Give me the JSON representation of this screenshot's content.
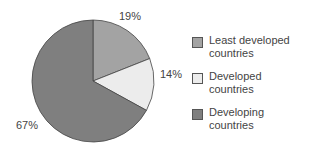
{
  "chart_data": {
    "type": "pie",
    "title": "",
    "categories": [
      "Least developed countries",
      "Developed countries",
      "Developing countries"
    ],
    "values": [
      19,
      14,
      67
    ],
    "labels": [
      "19%",
      "14%",
      "67%"
    ],
    "colors": [
      "#a3a3a3",
      "#ececec",
      "#7f7f7f"
    ],
    "start_angle_deg": 0,
    "direction": "clockwise",
    "legend_position": "right"
  },
  "legend": {
    "items": [
      {
        "line1": "Least developed",
        "line2": "countries",
        "color": "#a3a3a3"
      },
      {
        "line1": "Developed",
        "line2": "countries",
        "color": "#ececec"
      },
      {
        "line1": "Developing",
        "line2": "countries",
        "color": "#7f7f7f"
      }
    ]
  },
  "slice_labels": {
    "least": "19%",
    "developed": "14%",
    "developing": "67%"
  }
}
